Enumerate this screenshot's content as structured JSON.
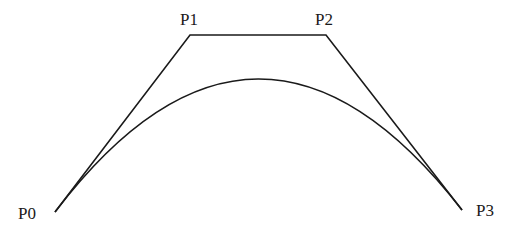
{
  "diagram": {
    "points": [
      {
        "id": "p0",
        "label": "P0",
        "x": 55,
        "y": 212,
        "label_x": 18,
        "label_y": 219
      },
      {
        "id": "p1",
        "label": "P1",
        "x": 190,
        "y": 35,
        "label_x": 180,
        "label_y": 25
      },
      {
        "id": "p2",
        "label": "P2",
        "x": 326,
        "y": 35,
        "label_x": 315,
        "label_y": 25
      },
      {
        "id": "p3",
        "label": "P3",
        "x": 462,
        "y": 210,
        "label_x": 476,
        "label_y": 216
      }
    ],
    "colors": {
      "stroke": "#1a1a1a",
      "background": "#ffffff"
    }
  }
}
